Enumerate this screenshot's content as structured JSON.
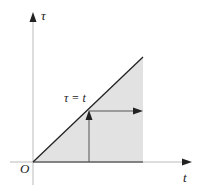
{
  "diagram": {
    "axes": {
      "vertical_label": "τ",
      "horizontal_label": "t",
      "origin_label": "O"
    },
    "line_label": "τ = t",
    "colors": {
      "region_fill": "#e2e2e2",
      "line": "#222222",
      "axis": "#bbbbbb",
      "arrow": "#222222"
    }
  }
}
